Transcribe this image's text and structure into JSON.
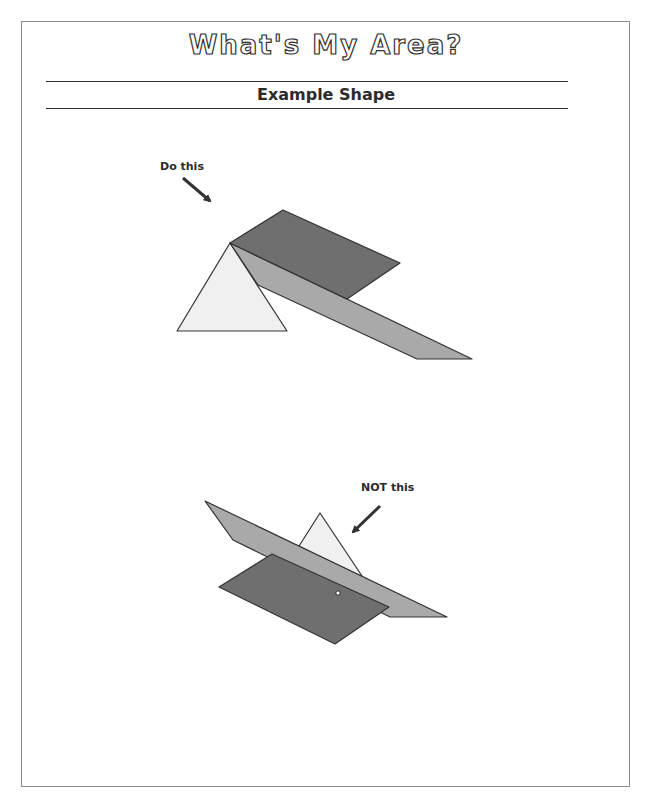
{
  "page": {
    "title": "What's My Area?",
    "subtitle": "Example Shape"
  },
  "examples": [
    {
      "label": "Do this",
      "kind": "correct",
      "shapes": [
        {
          "name": "triangle",
          "fill": "#f0f0f0",
          "points": "230,243 177,331 287,331"
        },
        {
          "name": "strip",
          "fill": "#a9a9a9",
          "points": "230,243 472,359 417,359 258,285"
        },
        {
          "name": "parallelogram",
          "fill": "#6f6f6f",
          "points": "230,243 283,210 400,263 347,299"
        }
      ],
      "arrow": {
        "x1": 183,
        "y1": 178,
        "x2": 210,
        "y2": 201
      }
    },
    {
      "label": "NOT this",
      "kind": "incorrect",
      "shapes": [
        {
          "name": "triangle",
          "fill": "#f0f0f0",
          "points": "320,513 280,576 362,576"
        },
        {
          "name": "strip",
          "fill": "#a9a9a9",
          "points": "205,501 447,617 390,617 233,540"
        },
        {
          "name": "parallelogram",
          "fill": "#6f6f6f",
          "points": "272,554 389,607 335,644 219,587"
        }
      ],
      "arrow": {
        "x1": 380,
        "y1": 506,
        "x2": 353,
        "y2": 532
      },
      "marker": {
        "cx": 338,
        "cy": 593
      }
    }
  ],
  "colors": {
    "outline": "#333333",
    "dark_shape": "#6f6f6f",
    "medium_shape": "#a9a9a9",
    "light_shape": "#f0f0f0"
  }
}
